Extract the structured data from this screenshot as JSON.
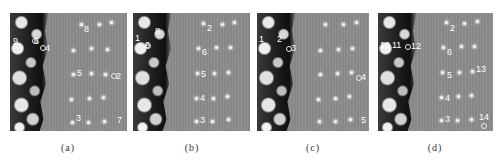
{
  "figure": {
    "panels": [
      {
        "id": "a",
        "caption": "(a)",
        "labels": [
          "8",
          "9",
          "6",
          "4",
          "5",
          "2",
          "3",
          "7"
        ]
      },
      {
        "id": "b",
        "caption": "(b)",
        "labels": [
          "1",
          "8",
          "9",
          "2",
          "6",
          "5",
          "4",
          "3"
        ]
      },
      {
        "id": "c",
        "caption": "(c)",
        "labels": [
          "1",
          "2",
          "3",
          "4",
          "5"
        ]
      },
      {
        "id": "d",
        "caption": "(d)",
        "labels": [
          "10",
          "11",
          "12",
          "2",
          "6",
          "5",
          "13",
          "4",
          "3",
          "14"
        ]
      }
    ]
  }
}
